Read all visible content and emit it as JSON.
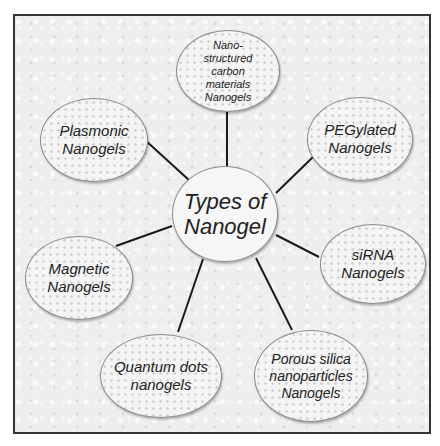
{
  "diagram": {
    "center": {
      "label": "Types of\nNanogel"
    },
    "nodes": [
      {
        "id": "nanostructured-carbon",
        "label": "Nano-\nstructured\ncarbon\nmaterials\nNanogels"
      },
      {
        "id": "pegylated",
        "label": "PEGylated\nNanogels"
      },
      {
        "id": "sirna",
        "label": "siRNA\nNanogels"
      },
      {
        "id": "porous-silica",
        "label": "Porous silica\nnanoparticles\nNanogels"
      },
      {
        "id": "quantum-dots",
        "label": "Quantum dots\nnanogels"
      },
      {
        "id": "magnetic",
        "label": "Magnetic\nNanogels"
      },
      {
        "id": "plasmonic",
        "label": "Plasmonic\nNanogels"
      }
    ],
    "colors": {
      "frame_border": "#333333",
      "line": "#1a1a1a",
      "ellipse_border": "#8a8a8a",
      "text": "#222222"
    }
  }
}
